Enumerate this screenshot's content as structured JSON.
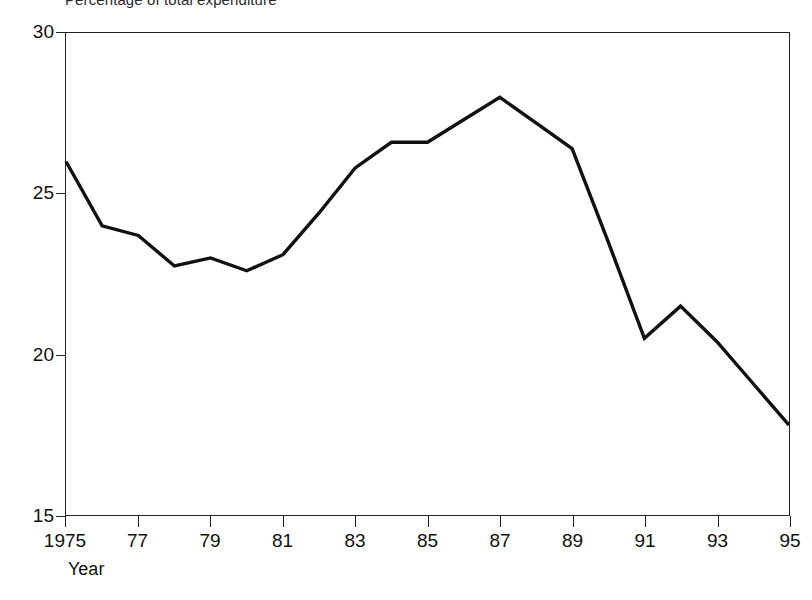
{
  "chart_data": {
    "type": "line",
    "title": "Percentage of total expenditure",
    "subtitle": "",
    "xlabel": "Year",
    "ylabel": "",
    "x": [
      1975,
      1976,
      1977,
      1978,
      1979,
      1980,
      1981,
      1982,
      1983,
      1984,
      1985,
      1986,
      1987,
      1988,
      1989,
      1990,
      1991,
      1992,
      1993,
      1994,
      1995
    ],
    "values": [
      26.0,
      24.0,
      23.7,
      22.75,
      23.0,
      22.6,
      23.1,
      24.4,
      25.8,
      26.6,
      26.6,
      27.3,
      28.0,
      27.2,
      26.4,
      23.5,
      20.5,
      21.5,
      20.4,
      19.1,
      17.8
    ],
    "series": [
      {
        "name": "Percentage of total expenditure",
        "values": [
          26.0,
          24.0,
          23.7,
          22.75,
          23.0,
          22.6,
          23.1,
          24.4,
          25.8,
          26.6,
          26.6,
          27.3,
          28.0,
          27.2,
          26.4,
          23.5,
          20.5,
          21.5,
          20.4,
          19.1,
          17.8
        ],
        "color": "#111111"
      }
    ],
    "xlim": [
      1975,
      1995
    ],
    "ylim": [
      15,
      30
    ],
    "xticks": [
      1975,
      1977,
      1979,
      1981,
      1983,
      1985,
      1987,
      1989,
      1991,
      1993,
      1995
    ],
    "xtick_labels": [
      "1975",
      "77",
      "79",
      "81",
      "83",
      "85",
      "87",
      "89",
      "91",
      "93",
      "95"
    ],
    "yticks": [
      15,
      20,
      25,
      30
    ],
    "ytick_labels": [
      "15",
      "20",
      "25",
      "30"
    ],
    "grid": false,
    "legend": false,
    "legend_position": "none",
    "line_color": "#111111",
    "frame_color": "#222222",
    "background_color": "#ffffff",
    "annotations": []
  }
}
